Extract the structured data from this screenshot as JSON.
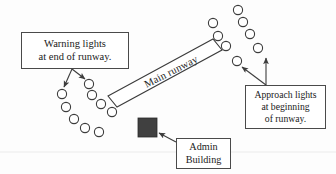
{
  "diagram": {
    "background_color": "#fdfdfd",
    "stroke_color": "#3c3c3c",
    "building_fill": "#404040"
  },
  "runway": {
    "label": "Main runway",
    "rotation_deg": -27,
    "fill": "#ffffff",
    "stroke": "#3c3c3c"
  },
  "callouts": {
    "warning": {
      "line1": "Warning lights",
      "line2": "at end of runway.",
      "arrow_count": 2
    },
    "approach": {
      "line1": "Approach lights",
      "line2": "at beginning",
      "line3": "of runway.",
      "arrow_count": 2
    },
    "admin": {
      "line1": "Admin",
      "line2": "Building",
      "arrow_count": 1
    }
  },
  "lights": {
    "warning_group_name": "warning-lights",
    "approach_group_name": "approach-lights",
    "warning_outer": [
      {
        "cx": 62,
        "cy": 94
      },
      {
        "cx": 66,
        "cy": 107
      },
      {
        "cx": 74,
        "cy": 119
      },
      {
        "cx": 85,
        "cy": 128
      },
      {
        "cx": 99,
        "cy": 132
      }
    ],
    "warning_inner": [
      {
        "cx": 89,
        "cy": 84
      },
      {
        "cx": 92,
        "cy": 95
      },
      {
        "cx": 101,
        "cy": 104
      },
      {
        "cx": 112,
        "cy": 112
      }
    ],
    "approach_outer": [
      {
        "cx": 213,
        "cy": 23
      },
      {
        "cx": 218,
        "cy": 36
      },
      {
        "cx": 226,
        "cy": 46
      },
      {
        "cx": 237,
        "cy": 61
      }
    ],
    "approach_inner": [
      {
        "cx": 238,
        "cy": 10
      },
      {
        "cx": 243,
        "cy": 22
      },
      {
        "cx": 250,
        "cy": 34
      },
      {
        "cx": 258,
        "cy": 48
      }
    ],
    "radius": 4.6
  }
}
